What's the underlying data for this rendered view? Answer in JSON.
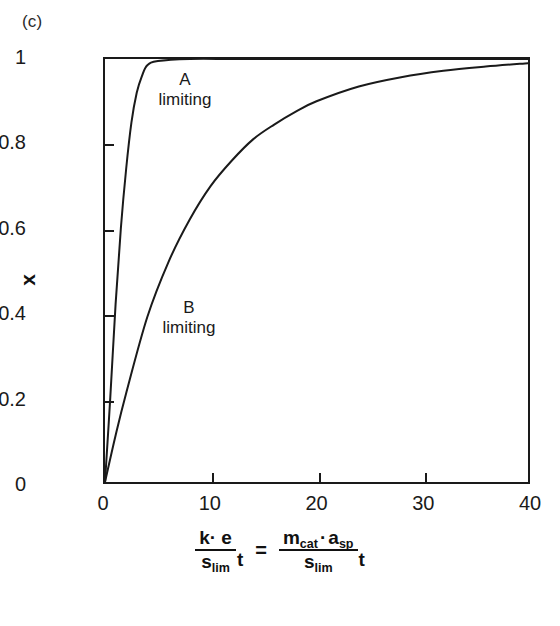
{
  "figure": {
    "panel_label": "(c)",
    "background": "#ffffff",
    "line_color": "#1a1a1a"
  },
  "axes": {
    "y_title": "x",
    "y_ticks": [
      "0",
      "0.2",
      "0.4",
      "0.6",
      "0.8",
      "1"
    ],
    "x_ticks": [
      "0",
      "10",
      "20",
      "30",
      "40"
    ],
    "x_title_parts": {
      "lhs_num": "k· e",
      "lhs_den_base": "s",
      "lhs_den_sub": "lim",
      "lhs_var": "t",
      "equals": "=",
      "rhs_num_a_base": "m",
      "rhs_num_a_sub": "cat",
      "rhs_num_dot": "·",
      "rhs_num_b_base": "a",
      "rhs_num_b_sub": "sp",
      "rhs_den_base": "s",
      "rhs_den_sub": "lim",
      "rhs_var": "t"
    }
  },
  "annotations": [
    {
      "id": "a",
      "line1": "A",
      "line2": "limiting"
    },
    {
      "id": "b",
      "line1": "B",
      "line2": "limiting"
    }
  ],
  "chart_data": {
    "type": "line",
    "title": "",
    "subtitle": "",
    "panel": "(c)",
    "xlabel": "(k·e / s_lim) t = (m_cat · a_sp / s_lim) t",
    "ylabel": "x",
    "xlim": [
      0,
      40
    ],
    "ylim": [
      0,
      1
    ],
    "xticks": [
      0,
      10,
      20,
      30,
      40
    ],
    "yticks": [
      0,
      0.2,
      0.4,
      0.6,
      0.8,
      1
    ],
    "grid": false,
    "legend": "none (inline curve annotations)",
    "series": [
      {
        "name": "A limiting",
        "annotation": "A limiting",
        "description": "Rapid saturation; conversion reaches ~1 by dimensionless time 4",
        "x": [
          0,
          0.5,
          1,
          1.5,
          2,
          2.5,
          3,
          3.5,
          4,
          5,
          8,
          12,
          16,
          20,
          25,
          30,
          35,
          40
        ],
        "y": [
          0,
          0.2,
          0.42,
          0.6,
          0.74,
          0.85,
          0.92,
          0.96,
          0.985,
          0.995,
          1.0,
          1.0,
          1.0,
          1.0,
          1.0,
          1.0,
          1.0,
          1.0
        ]
      },
      {
        "name": "B limiting",
        "annotation": "B limiting",
        "description": "Gradual exponential approach to full conversion near dimensionless time 40",
        "x": [
          0,
          1,
          2,
          4,
          6,
          8,
          10,
          12,
          14,
          16,
          18,
          20,
          24,
          28,
          32,
          36,
          40
        ],
        "y": [
          0,
          0.11,
          0.21,
          0.39,
          0.52,
          0.62,
          0.7,
          0.76,
          0.81,
          0.845,
          0.875,
          0.9,
          0.935,
          0.957,
          0.972,
          0.982,
          0.99
        ]
      }
    ]
  }
}
